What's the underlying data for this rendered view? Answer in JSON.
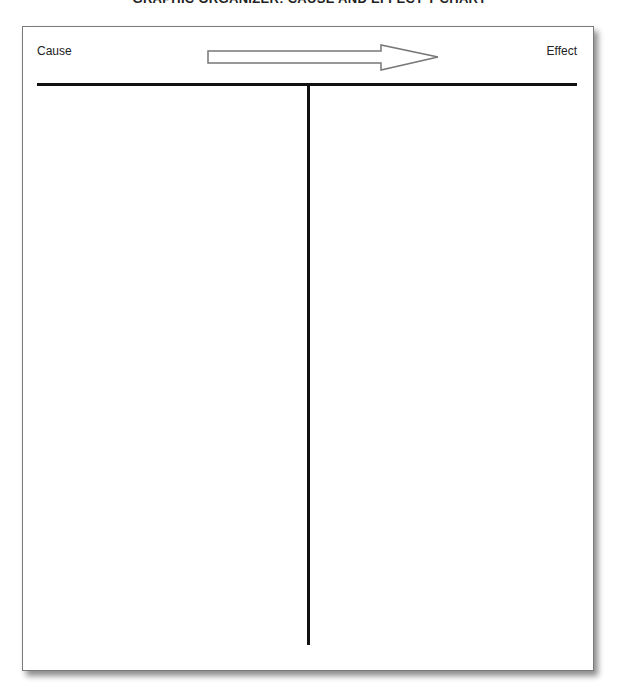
{
  "title": "GRAPHIC ORGANIZER: CAUSE AND EFFECT T-CHART",
  "chart": {
    "left_heading": "Cause",
    "right_heading": "Effect",
    "arrow_icon": "right-arrow-icon"
  }
}
